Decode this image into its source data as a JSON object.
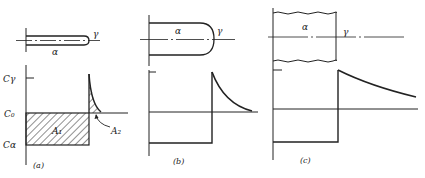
{
  "figure": {
    "panels": [
      {
        "id": "a",
        "caption": "(a)",
        "phase_left": "α",
        "phase_right": "γ",
        "y_labels": {
          "c_gamma": "Cγ",
          "c0": "C₀",
          "c_alpha": "Cα"
        },
        "area_labels": {
          "a1": "A₁",
          "a2": "A₂"
        }
      },
      {
        "id": "b",
        "caption": "(b)",
        "phase_left": "α",
        "phase_right": "γ"
      },
      {
        "id": "c",
        "caption": "(c)",
        "phase_left": "α",
        "phase_right": "γ"
      }
    ],
    "colors": {
      "ink": "#222222",
      "background": "#ffffff"
    }
  }
}
